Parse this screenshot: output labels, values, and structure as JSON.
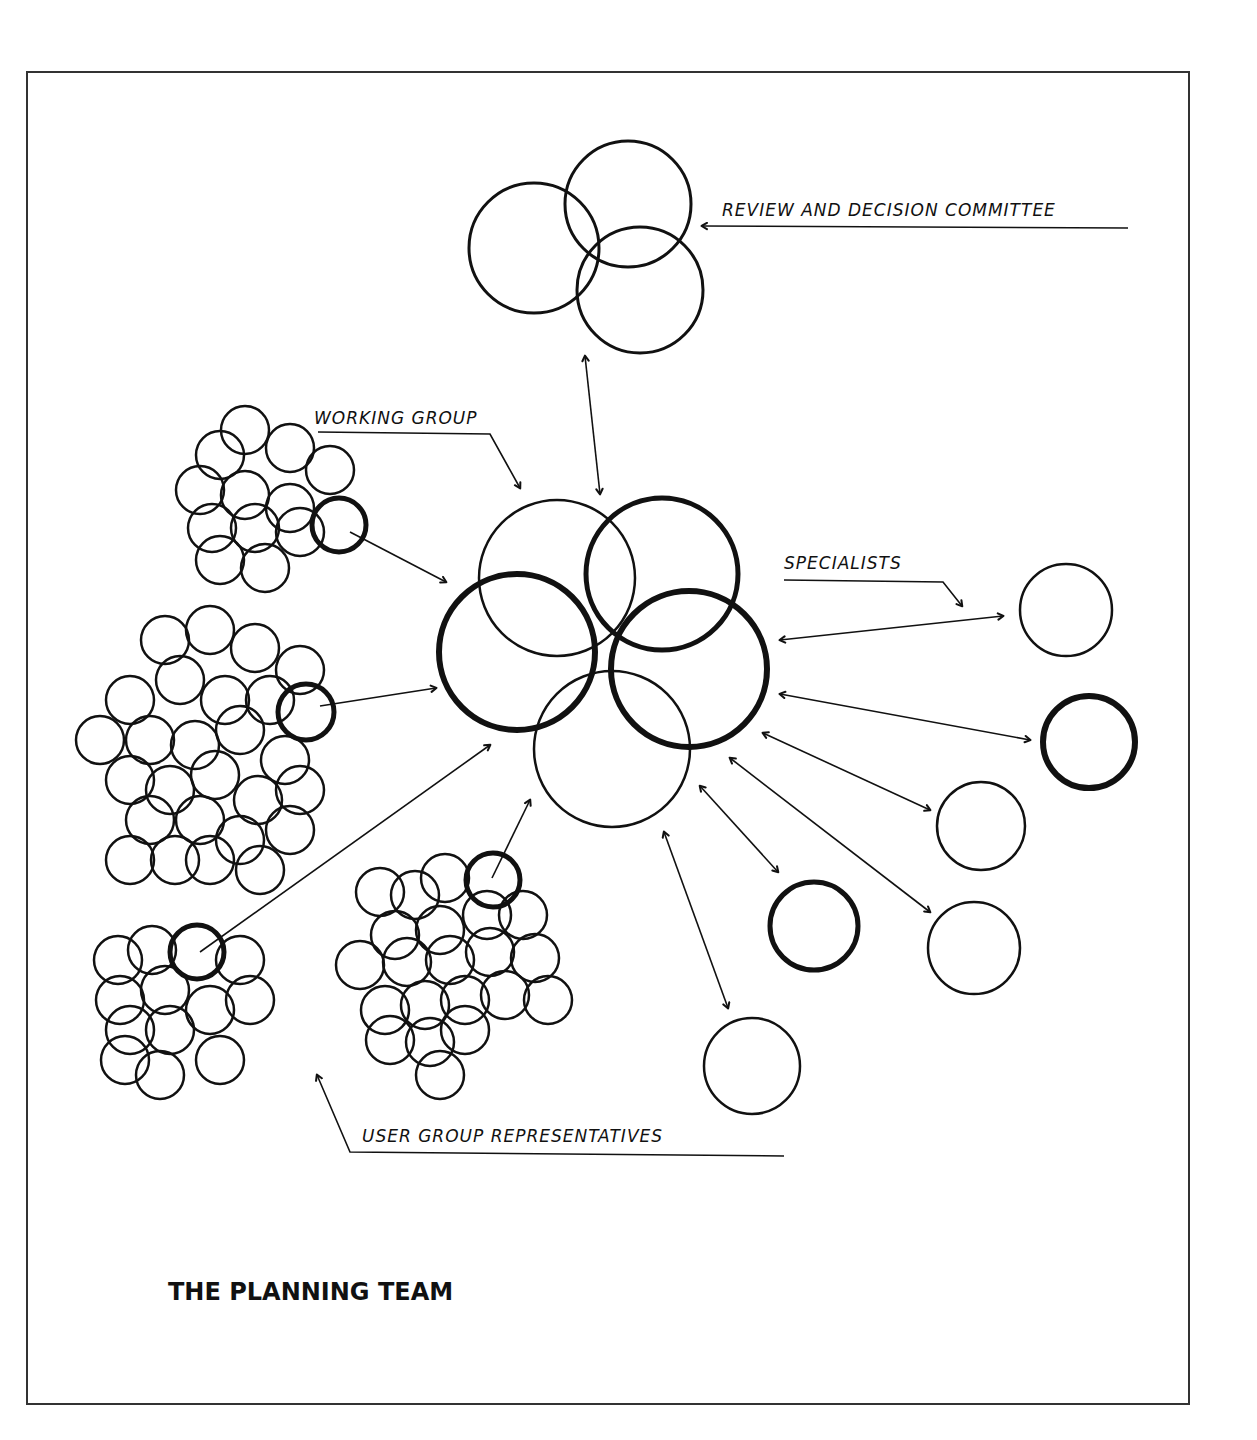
{
  "diagram": {
    "title": "THE PLANNING TEAM",
    "stroke_color": "#111111",
    "background": "#ffffff",
    "frame": {
      "x": 27,
      "y": 72,
      "w": 1162,
      "h": 1332
    },
    "labels": {
      "review_committee": "REVIEW AND DECISION COMMITTEE",
      "working_group": "WORKING GROUP",
      "specialists": "SPECIALISTS",
      "user_group_reps": "USER GROUP REPRESENTATIVES"
    },
    "nodes": {
      "review_committee": {
        "circles": [
          {
            "cx": 534,
            "cy": 248,
            "r": 65,
            "w": 3
          },
          {
            "cx": 628,
            "cy": 204,
            "r": 63,
            "w": 3
          },
          {
            "cx": 640,
            "cy": 290,
            "r": 63,
            "w": 3
          }
        ]
      },
      "working_group": {
        "circles": [
          {
            "cx": 557,
            "cy": 578,
            "r": 78,
            "w": 2.5
          },
          {
            "cx": 662,
            "cy": 574,
            "r": 76,
            "w": 5
          },
          {
            "cx": 517,
            "cy": 652,
            "r": 78,
            "w": 6
          },
          {
            "cx": 689,
            "cy": 669,
            "r": 78,
            "w": 6
          },
          {
            "cx": 612,
            "cy": 749,
            "r": 78,
            "w": 2.5
          }
        ]
      },
      "specialists": [
        {
          "cx": 1066,
          "cy": 610,
          "r": 46,
          "w": 2.5
        },
        {
          "cx": 1089,
          "cy": 742,
          "r": 46,
          "w": 6
        },
        {
          "cx": 981,
          "cy": 826,
          "r": 44,
          "w": 2.5
        },
        {
          "cx": 814,
          "cy": 926,
          "r": 44,
          "w": 5
        },
        {
          "cx": 974,
          "cy": 948,
          "r": 46,
          "w": 2.5
        },
        {
          "cx": 752,
          "cy": 1066,
          "r": 48,
          "w": 2.5
        }
      ],
      "user_groups": [
        {
          "name": "cluster-top-left",
          "hl": {
            "cx": 339,
            "cy": 525,
            "r": 27
          },
          "circles": [
            [
              220,
              455
            ],
            [
              245,
              430
            ],
            [
              290,
              448
            ],
            [
              330,
              470
            ],
            [
              200,
              490
            ],
            [
              245,
              495
            ],
            [
              290,
              508
            ],
            [
              212,
              528
            ],
            [
              255,
              528
            ],
            [
              300,
              532
            ],
            [
              220,
              560
            ],
            [
              265,
              568
            ]
          ]
        },
        {
          "name": "cluster-mid-left",
          "hl": {
            "cx": 306,
            "cy": 712,
            "r": 28
          },
          "circles": [
            [
              165,
              640
            ],
            [
              210,
              630
            ],
            [
              255,
              648
            ],
            [
              300,
              670
            ],
            [
              130,
              700
            ],
            [
              180,
              680
            ],
            [
              225,
              700
            ],
            [
              270,
              700
            ],
            [
              100,
              740
            ],
            [
              150,
              740
            ],
            [
              195,
              745
            ],
            [
              240,
              730
            ],
            [
              285,
              760
            ],
            [
              130,
              780
            ],
            [
              170,
              790
            ],
            [
              215,
              775
            ],
            [
              258,
              800
            ],
            [
              300,
              790
            ],
            [
              150,
              820
            ],
            [
              200,
              820
            ],
            [
              240,
              840
            ],
            [
              290,
              830
            ],
            [
              130,
              860
            ],
            [
              175,
              860
            ],
            [
              210,
              860
            ],
            [
              260,
              870
            ]
          ]
        },
        {
          "name": "cluster-bottom-left",
          "hl": {
            "cx": 197,
            "cy": 952,
            "r": 27
          },
          "circles": [
            [
              152,
              950
            ],
            [
              118,
              960
            ],
            [
              165,
              990
            ],
            [
              240,
              960
            ],
            [
              120,
              1000
            ],
            [
              210,
              1010
            ],
            [
              250,
              1000
            ],
            [
              130,
              1030
            ],
            [
              170,
              1030
            ],
            [
              125,
              1060
            ],
            [
              160,
              1075
            ],
            [
              220,
              1060
            ]
          ]
        },
        {
          "name": "cluster-bottom-center",
          "hl": {
            "cx": 493,
            "cy": 880,
            "r": 27
          },
          "circles": [
            [
              380,
              892
            ],
            [
              415,
              895
            ],
            [
              445,
              878
            ],
            [
              395,
              935
            ],
            [
              440,
              930
            ],
            [
              487,
              915
            ],
            [
              523,
              915
            ],
            [
              360,
              965
            ],
            [
              407,
              962
            ],
            [
              450,
              960
            ],
            [
              490,
              952
            ],
            [
              535,
              958
            ],
            [
              385,
              1010
            ],
            [
              425,
              1005
            ],
            [
              465,
              1000
            ],
            [
              505,
              995
            ],
            [
              548,
              1000
            ],
            [
              390,
              1040
            ],
            [
              430,
              1042
            ],
            [
              465,
              1030
            ],
            [
              440,
              1075
            ]
          ]
        }
      ]
    },
    "arrows": [
      {
        "id": "committee-link",
        "from": [
          600,
          494
        ],
        "to": [
          585,
          356
        ],
        "both": true
      },
      {
        "id": "wg-label-pointer",
        "path": "M 318 432 L 490 434 L 520 488",
        "head": [
          520,
          488
        ]
      },
      {
        "id": "cluster-tl-link",
        "from": [
          350,
          532
        ],
        "to": [
          446,
          582
        ],
        "both": false
      },
      {
        "id": "cluster-ml-link",
        "from": [
          320,
          706
        ],
        "to": [
          436,
          688
        ],
        "both": false
      },
      {
        "id": "cluster-bl-link",
        "from": [
          200,
          952
        ],
        "to": [
          490,
          745
        ],
        "both": false
      },
      {
        "id": "cluster-bc-link",
        "from": [
          492,
          878
        ],
        "to": [
          530,
          800
        ],
        "both": false
      },
      {
        "id": "spec-1-link",
        "from": [
          780,
          640
        ],
        "to": [
          1003,
          616
        ],
        "both": true
      },
      {
        "id": "spec-2-link",
        "from": [
          780,
          694
        ],
        "to": [
          1030,
          740
        ],
        "both": true
      },
      {
        "id": "spec-3-link",
        "from": [
          763,
          733
        ],
        "to": [
          930,
          810
        ],
        "both": true
      },
      {
        "id": "spec-4-link",
        "from": [
          700,
          786
        ],
        "to": [
          778,
          872
        ],
        "both": true
      },
      {
        "id": "spec-5-link",
        "from": [
          730,
          758
        ],
        "to": [
          930,
          912
        ],
        "both": true
      },
      {
        "id": "spec-6-link",
        "from": [
          664,
          832
        ],
        "to": [
          728,
          1008
        ],
        "both": true
      },
      {
        "id": "spec-label-pointer",
        "path": "M 784 580 L 943 582 L 962 606",
        "head": [
          962,
          606
        ]
      },
      {
        "id": "committee-label-pointer",
        "path": "M 1128 228 L 702 226",
        "head": [
          702,
          226
        ]
      },
      {
        "id": "ugr-label-pointer",
        "path": "M 784 1156 L 350 1152 L 317 1075",
        "head": [
          317,
          1075
        ]
      }
    ]
  }
}
